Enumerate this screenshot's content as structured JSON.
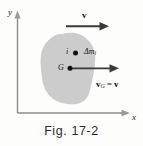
{
  "figure": {
    "caption": "Fig. 17-2",
    "axes": {
      "y_label": "y",
      "x_label": "x"
    },
    "labels": {
      "top_velocity": "v",
      "particle_index": "i",
      "mass_element": "Δm",
      "mass_element_sub": "i",
      "centroid": "G",
      "centroid_velocity": "v",
      "centroid_velocity_sub": "G",
      "equals": "=",
      "body_velocity": "v"
    },
    "colors": {
      "body_fill": "#c9c9c9",
      "axis": "#8d8d8d",
      "vector": "#3a3a3a",
      "text": "#111111",
      "background": "#fdfdfc"
    },
    "icons": {
      "top_arrow": "right-arrow-icon",
      "centroid_arrow": "right-arrow-icon",
      "y_axis_arrow": "up-arrow-icon",
      "x_axis_arrow": "right-arrow-icon",
      "point_i": "dot-icon",
      "point_g": "dot-icon"
    }
  }
}
